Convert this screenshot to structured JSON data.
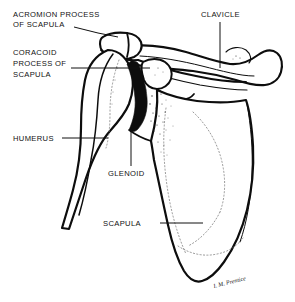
{
  "figure": {
    "background_color": "#ffffff",
    "ink_color": "#0d0d0d",
    "width": 295,
    "height": 302
  },
  "labels": [
    {
      "id": "acromion",
      "name": "acromion-process-of-scapula",
      "lines": [
        "ACROMION PROCESS",
        "OF SCAPULA"
      ],
      "line1": "ACROMION PROCESS",
      "line2": "OF SCAPULA",
      "text_x": 13,
      "text_y": 17,
      "leader": "M 74,27 L 98,33 L 118,37"
    },
    {
      "id": "coracoid",
      "name": "coracoid-process-of-scapula",
      "lines": [
        "CORACOID",
        "PROCESS OF",
        "SCAPULA"
      ],
      "line1": "CORACOID",
      "line2": "PROCESS OF",
      "line3": "SCAPULA",
      "text_x": 13,
      "text_y": 55,
      "leader": "M 71,68 L 150,68"
    },
    {
      "id": "humerus",
      "name": "humerus",
      "lines": [
        "HUMERUS"
      ],
      "line1": "HUMERUS",
      "text_x": 13,
      "text_y": 141,
      "leader": "M 62,138 L 108,138"
    },
    {
      "id": "glenoid",
      "name": "glenoid",
      "lines": [
        "GLENOID"
      ],
      "line1": "GLENOID",
      "text_x": 108,
      "text_y": 176,
      "leader": "M 131,129 L 131,166"
    },
    {
      "id": "scapula",
      "name": "scapula",
      "lines": [
        "SCAPULA"
      ],
      "line1": "SCAPULA",
      "text_x": 103,
      "text_y": 226,
      "leader": "M 160,223 L 203,223"
    },
    {
      "id": "clavicle",
      "name": "clavicle",
      "lines": [
        "CLAVICLE"
      ],
      "line1": "CLAVICLE",
      "text_x": 201,
      "text_y": 17,
      "leader": "M 220,22 L 220,68"
    }
  ],
  "structures": [
    {
      "id": "clavicle-bone",
      "name": "clavicle-bone"
    },
    {
      "id": "acromion-bone",
      "name": "acromion-process-bone"
    },
    {
      "id": "coracoid-bone",
      "name": "coracoid-process-bone"
    },
    {
      "id": "humerus-bone",
      "name": "humerus-bone"
    },
    {
      "id": "glenoid-joint-space",
      "name": "glenoid-joint-space"
    },
    {
      "id": "scapula-body",
      "name": "scapula-body"
    }
  ],
  "signature": {
    "text": "I. M. Prentice",
    "x": 214,
    "y": 288
  }
}
